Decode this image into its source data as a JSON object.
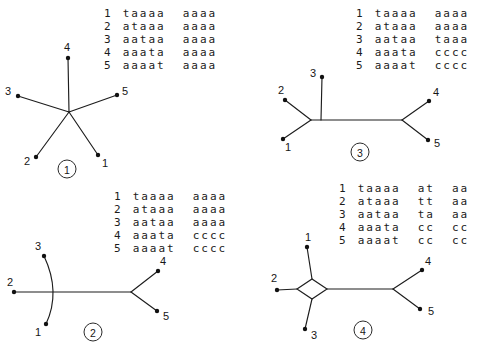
{
  "panels": [
    {
      "circled_number": "1",
      "tree_type": "unresolved star tree",
      "leaf_labels": [
        "1",
        "2",
        "3",
        "4",
        "5"
      ],
      "alignment": [
        {
          "taxon": "1",
          "groups": [
            "taaaa",
            "aaaa"
          ]
        },
        {
          "taxon": "2",
          "groups": [
            "ataaa",
            "aaaa"
          ]
        },
        {
          "taxon": "3",
          "groups": [
            "aataa",
            "aaaa"
          ]
        },
        {
          "taxon": "4",
          "groups": [
            "aaata",
            "aaaa"
          ]
        },
        {
          "taxon": "5",
          "groups": [
            "aaaat",
            "aaaa"
          ]
        }
      ]
    },
    {
      "circled_number": "2",
      "tree_type": "unrooted tree ((1,2,3),(4,5))",
      "leaf_labels": [
        "1",
        "2",
        "3",
        "4",
        "5"
      ],
      "alignment": [
        {
          "taxon": "1",
          "groups": [
            "taaaa",
            "aaaa"
          ]
        },
        {
          "taxon": "2",
          "groups": [
            "ataaa",
            "aaaa"
          ]
        },
        {
          "taxon": "3",
          "groups": [
            "aataa",
            "aaaa"
          ]
        },
        {
          "taxon": "4",
          "groups": [
            "aaata",
            "cccc"
          ]
        },
        {
          "taxon": "5",
          "groups": [
            "aaaat",
            "cccc"
          ]
        }
      ]
    },
    {
      "circled_number": "3",
      "tree_type": "unrooted tree ((1,2),3,(4,5))",
      "leaf_labels": [
        "1",
        "2",
        "3",
        "4",
        "5"
      ],
      "alignment": [
        {
          "taxon": "1",
          "groups": [
            "taaaa",
            "aaaa"
          ]
        },
        {
          "taxon": "2",
          "groups": [
            "ataaa",
            "aaaa"
          ]
        },
        {
          "taxon": "3",
          "groups": [
            "aataa",
            "taaa"
          ]
        },
        {
          "taxon": "4",
          "groups": [
            "aaata",
            "cccc"
          ]
        },
        {
          "taxon": "5",
          "groups": [
            "aaaat",
            "cccc"
          ]
        }
      ]
    },
    {
      "circled_number": "4",
      "tree_type": "network with diamond at (1,2,3) node and (4,5) cherry",
      "leaf_labels": [
        "1",
        "2",
        "3",
        "4",
        "5"
      ],
      "alignment": [
        {
          "taxon": "1",
          "groups": [
            "taaaa",
            "at",
            "aa"
          ]
        },
        {
          "taxon": "2",
          "groups": [
            "ataaa",
            "tt",
            "aa"
          ]
        },
        {
          "taxon": "3",
          "groups": [
            "aataa",
            "ta",
            "aa"
          ]
        },
        {
          "taxon": "4",
          "groups": [
            "aaata",
            "cc",
            "cc"
          ]
        },
        {
          "taxon": "5",
          "groups": [
            "aaaat",
            "cc",
            "cc"
          ]
        }
      ]
    }
  ]
}
